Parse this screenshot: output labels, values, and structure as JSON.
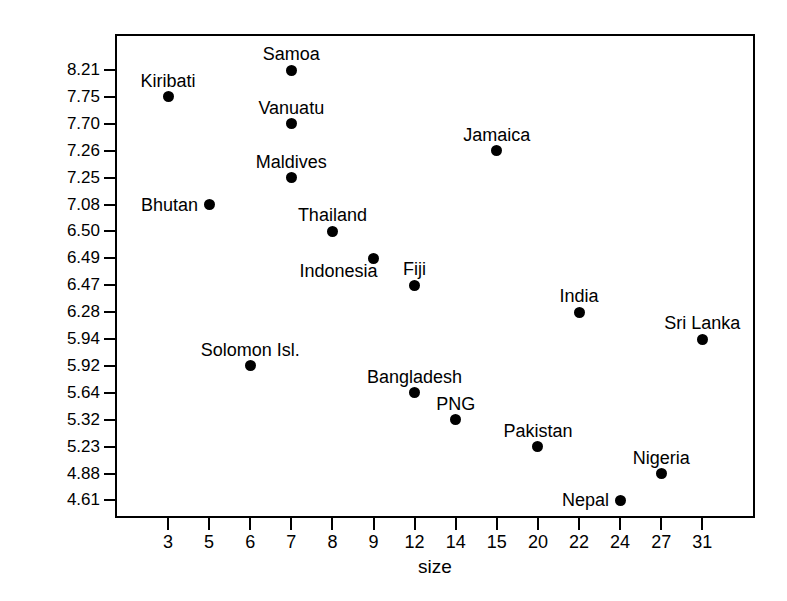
{
  "chart_data": {
    "type": "scatter",
    "title": "",
    "xlabel": "size",
    "ylabel": "state weakness",
    "grid": false,
    "legend": "none",
    "xtick_labels": [
      "3",
      "5",
      "6",
      "7",
      "8",
      "9",
      "12",
      "14",
      "15",
      "20",
      "22",
      "24",
      "27",
      "31"
    ],
    "ytick_labels": [
      "8.21",
      "7.75",
      "7.70",
      "7.26",
      "7.25",
      "7.08",
      "6.50",
      "6.49",
      "6.47",
      "6.28",
      "5.94",
      "5.92",
      "5.64",
      "5.32",
      "5.23",
      "4.88",
      "4.61"
    ],
    "xlim": [
      0,
      15
    ],
    "ylim": [
      0,
      18
    ],
    "point_color": "#000000",
    "points": [
      {
        "label": "Samoa",
        "size": 7,
        "weakness": 8.21,
        "label_pos": "above"
      },
      {
        "label": "Kiribati",
        "size": 3,
        "weakness": 7.75,
        "label_pos": "above"
      },
      {
        "label": "Vanuatu",
        "size": 7,
        "weakness": 7.7,
        "label_pos": "above"
      },
      {
        "label": "Jamaica",
        "size": 15,
        "weakness": 7.26,
        "label_pos": "above"
      },
      {
        "label": "Maldives",
        "size": 7,
        "weakness": 7.25,
        "label_pos": "above"
      },
      {
        "label": "Bhutan",
        "size": 5,
        "weakness": 7.08,
        "label_pos": "above-left"
      },
      {
        "label": "Thailand",
        "size": 8,
        "weakness": 6.5,
        "label_pos": "above"
      },
      {
        "label": "Indonesia",
        "size": 9,
        "weakness": 6.49,
        "label_pos": "below-left"
      },
      {
        "label": "Fiji",
        "size": 12,
        "weakness": 6.47,
        "label_pos": "above"
      },
      {
        "label": "India",
        "size": 22,
        "weakness": 6.28,
        "label_pos": "above"
      },
      {
        "label": "Sri Lanka",
        "size": 31,
        "weakness": 5.94,
        "label_pos": "above"
      },
      {
        "label": "Solomon Isl.",
        "size": 6,
        "weakness": 5.92,
        "label_pos": "above"
      },
      {
        "label": "Bangladesh",
        "size": 12,
        "weakness": 5.64,
        "label_pos": "above"
      },
      {
        "label": "PNG",
        "size": 14,
        "weakness": 5.32,
        "label_pos": "above"
      },
      {
        "label": "Pakistan",
        "size": 20,
        "weakness": 5.23,
        "label_pos": "above"
      },
      {
        "label": "Nigeria",
        "size": 27,
        "weakness": 4.88,
        "label_pos": "above"
      },
      {
        "label": "Nepal",
        "size": 24,
        "weakness": 4.61,
        "label_pos": "above-left"
      }
    ]
  }
}
